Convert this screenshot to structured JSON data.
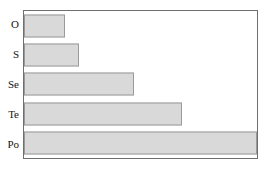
{
  "chart_data": {
    "type": "bar",
    "orientation": "horizontal",
    "title": "",
    "subtitle": "",
    "xlabel": "",
    "ylabel": "",
    "categories": [
      "O",
      "S",
      "Se",
      "Te",
      "Po"
    ],
    "values": [
      0.175,
      0.235,
      0.47,
      0.68,
      1.0
    ],
    "xlim": [
      0,
      1.0
    ],
    "ylim": null,
    "grid": false,
    "legend": null,
    "legend_position": "none",
    "tick_labels": {
      "x": [],
      "y": [
        "O",
        "S",
        "Se",
        "Te",
        "Po"
      ]
    },
    "annotations": [],
    "series": [
      {
        "name": "",
        "values": [
          0.175,
          0.235,
          0.47,
          0.68,
          1.0
        ]
      }
    ]
  },
  "style": {
    "bar_fill": "#d9d9d9",
    "bar_border": "#9a9a9a",
    "frame_border": "#6f6f6f",
    "background": "#ffffff",
    "label_color": "#16130f"
  },
  "bars": [
    {
      "category": "O",
      "value": 0.175,
      "label": "O"
    },
    {
      "category": "S",
      "value": 0.235,
      "label": "S"
    },
    {
      "category": "Se",
      "value": 0.47,
      "label": "Se"
    },
    {
      "category": "Te",
      "value": 0.68,
      "label": "Te"
    },
    {
      "category": "Po",
      "value": 1.0,
      "label": "Po"
    }
  ]
}
